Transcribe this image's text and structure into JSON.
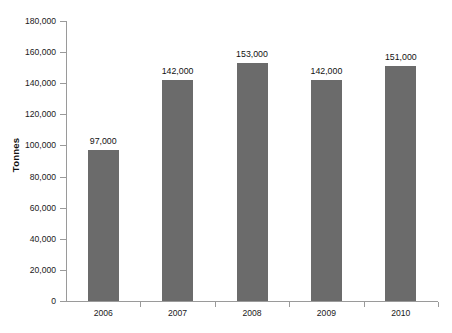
{
  "chart_data": {
    "type": "bar",
    "title": "",
    "subtitle": "",
    "xlabel": "",
    "ylabel": "Tonnes",
    "categories": [
      "2006",
      "2007",
      "2008",
      "2009",
      "2010"
    ],
    "values": [
      97000,
      142000,
      153000,
      142000,
      151000
    ],
    "data_labels": [
      "97,000",
      "142,000",
      "153,000",
      "142,000",
      "151,000"
    ],
    "ylim": [
      0,
      180000
    ],
    "ytick_values": [
      0,
      20000,
      40000,
      60000,
      80000,
      100000,
      120000,
      140000,
      160000,
      180000
    ],
    "ytick_labels": [
      "0",
      "20,000",
      "40,000",
      "60,000",
      "80,000",
      "100,000",
      "120,000",
      "140,000",
      "160,000",
      "180,000"
    ],
    "grid": false,
    "legend": null,
    "legend_position": "none",
    "series": [
      {
        "name": "Tonnes",
        "color": "#6b6b6b",
        "values": [
          97000,
          142000,
          153000,
          142000,
          151000
        ]
      }
    ],
    "axis_color": "#9a9a9a",
    "background_color": "#ffffff",
    "bar_color": "#6b6b6b"
  }
}
